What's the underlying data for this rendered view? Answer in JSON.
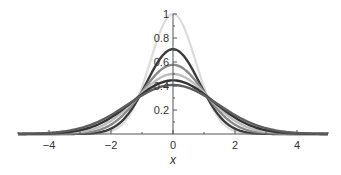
{
  "chart_data": {
    "type": "line",
    "title": "",
    "xlabel": "x",
    "ylabel": "",
    "xlim": [
      -5,
      5
    ],
    "ylim": [
      0,
      1
    ],
    "grid": false,
    "legend": null,
    "x_ticks": [
      {
        "value": -4,
        "label": "−4"
      },
      {
        "value": -2,
        "label": "−2"
      },
      {
        "value": 0,
        "label": "0"
      },
      {
        "value": 2,
        "label": "2"
      },
      {
        "value": 4,
        "label": "4"
      }
    ],
    "x_minor_ticks": [
      -5,
      -3,
      -1,
      1,
      3,
      5
    ],
    "y_ticks": [
      {
        "value": 0.2,
        "label": "0.2"
      },
      {
        "value": 0.4,
        "label": "0.4"
      },
      {
        "value": 0.6,
        "label": "0.6"
      },
      {
        "value": 0.8,
        "label": "0.8"
      },
      {
        "value": 1,
        "label": "1"
      }
    ],
    "y_minor_ticks": [
      0.1,
      0.3,
      0.5,
      0.7,
      0.9
    ],
    "x": [
      -5,
      -4.5,
      -4,
      -3.5,
      -3,
      -2.5,
      -2,
      -1.5,
      -1,
      -0.5,
      0,
      0.5,
      1,
      1.5,
      2,
      2.5,
      3,
      3.5,
      4,
      4.5,
      5
    ],
    "series": [
      {
        "name": "curve-1",
        "peak": 1.0,
        "sigma": 0.73,
        "color": "#dcdcdc",
        "width": 2.2,
        "values": [
          0.0,
          0.0,
          0.0,
          0.0,
          0.0,
          0.0,
          0.024,
          0.121,
          0.391,
          0.791,
          1.0,
          0.791,
          0.391,
          0.121,
          0.024,
          0.0,
          0.0,
          0.0,
          0.0,
          0.0,
          0.0
        ]
      },
      {
        "name": "curve-2",
        "peak": 0.707,
        "sigma": 0.85,
        "color": "#3c3c3c",
        "width": 2.4,
        "values": [
          0.0,
          0.0,
          0.0,
          0.0,
          0.001,
          0.009,
          0.044,
          0.149,
          0.354,
          0.595,
          0.707,
          0.595,
          0.354,
          0.149,
          0.044,
          0.009,
          0.001,
          0.0,
          0.0,
          0.0,
          0.0
        ]
      },
      {
        "name": "curve-3",
        "peak": 0.577,
        "sigma": 1.0,
        "color": "#8a8a8a",
        "width": 2.4,
        "values": [
          0.0,
          0.0,
          0.0,
          0.002,
          0.006,
          0.025,
          0.078,
          0.187,
          0.35,
          0.509,
          0.577,
          0.509,
          0.35,
          0.187,
          0.078,
          0.025,
          0.006,
          0.002,
          0.0,
          0.0,
          0.0
        ]
      },
      {
        "name": "curve-4",
        "peak": 0.5,
        "sigma": 1.15,
        "color": "#bdbdbd",
        "width": 2.4,
        "values": [
          0.0,
          0.0,
          0.001,
          0.005,
          0.017,
          0.047,
          0.11,
          0.213,
          0.342,
          0.455,
          0.5,
          0.455,
          0.342,
          0.213,
          0.11,
          0.047,
          0.017,
          0.005,
          0.001,
          0.0,
          0.0
        ]
      },
      {
        "name": "curve-5",
        "peak": 0.447,
        "sigma": 1.3,
        "color": "#333333",
        "width": 2.4,
        "values": [
          0.0,
          0.001,
          0.004,
          0.012,
          0.031,
          0.07,
          0.137,
          0.229,
          0.333,
          0.417,
          0.447,
          0.417,
          0.333,
          0.229,
          0.137,
          0.07,
          0.031,
          0.012,
          0.004,
          0.001,
          0.0
        ]
      },
      {
        "name": "curve-6",
        "peak": 0.408,
        "sigma": 1.45,
        "color": "#5e5e5e",
        "width": 2.4,
        "values": [
          0.001,
          0.003,
          0.009,
          0.022,
          0.048,
          0.091,
          0.158,
          0.24,
          0.323,
          0.384,
          0.408,
          0.384,
          0.323,
          0.24,
          0.158,
          0.091,
          0.048,
          0.022,
          0.009,
          0.003,
          0.001
        ]
      }
    ]
  },
  "layout": {
    "origin_px": [
      173,
      134
    ],
    "x_scale_px": 31.0,
    "y_scale_px": 120.0,
    "axis_color": "#555555"
  }
}
